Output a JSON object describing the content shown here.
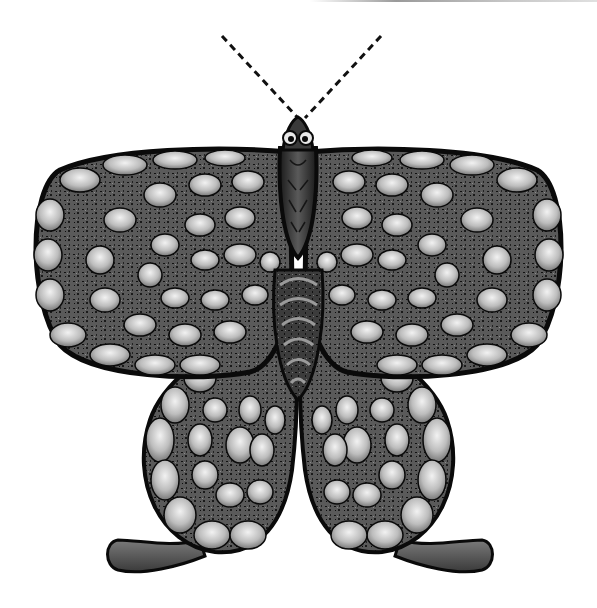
{
  "image": {
    "subject": "butterfly illustration",
    "style": "black-and-white decorative engraving",
    "alt": "Stylized butterfly with dashed antennae, scalloped concentric rings on forewings and hindwings, striped abdomen and teardrop hindwing tails"
  },
  "colors": {
    "background": "#ffffff",
    "outline": "#0a0a0a",
    "wing_dark": "#2a2a2a",
    "wing_mid": "#6e6e6e",
    "wing_light": "#d8d8d8",
    "body": "#3a3a3a",
    "top_rule": "#9a9a9a"
  },
  "parts": {
    "antennae": "dashed antennae",
    "head": "head with eye spots",
    "thorax": "thorax",
    "abdomen": "striped abdomen",
    "left_forewing": "left forewing",
    "right_forewing": "right forewing",
    "left_hindwing": "left hindwing",
    "right_hindwing": "right hindwing",
    "left_tail": "left tail",
    "right_tail": "right tail"
  }
}
